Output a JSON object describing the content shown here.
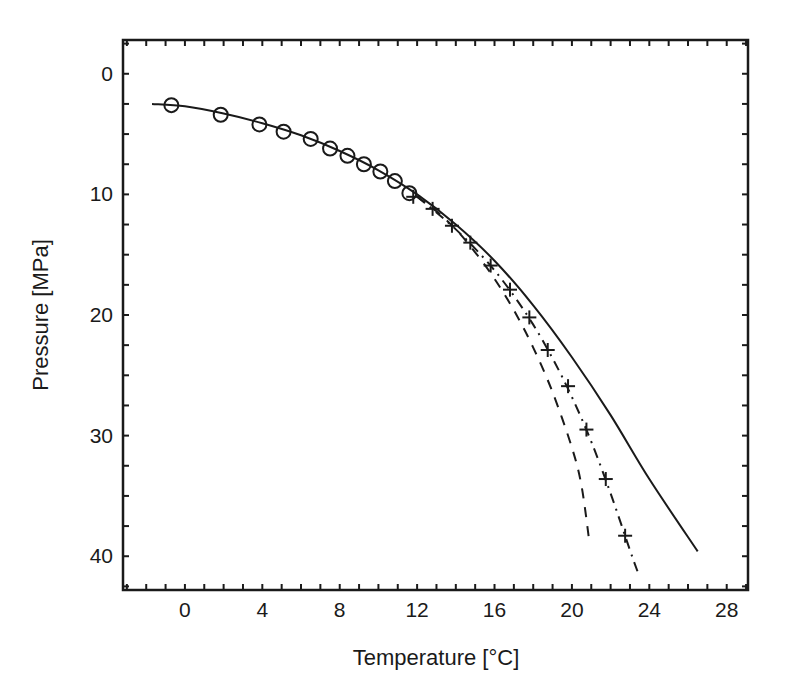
{
  "chart_data": {
    "type": "line",
    "title": "",
    "xlabel": "Temperature  [°C]",
    "ylabel": "Pressure  [MPa]",
    "xlim": [
      -3.2,
      29.1
    ],
    "ylim": [
      -2.8,
      42.8
    ],
    "y_inverted": true,
    "grid": false,
    "legend": null,
    "x_ticks": [
      0,
      4,
      8,
      12,
      16,
      20,
      24,
      28
    ],
    "y_ticks": [
      0,
      10,
      20,
      30,
      40
    ],
    "x_minor_step": 1,
    "y_minor_step": 2.5,
    "series": [
      {
        "name": "solid-curve",
        "style": "solid",
        "points": [
          [
            -1.7,
            2.5
          ],
          [
            0,
            2.7
          ],
          [
            2,
            3.3
          ],
          [
            4,
            4.1
          ],
          [
            6,
            5.1
          ],
          [
            8,
            6.4
          ],
          [
            10,
            8.0
          ],
          [
            12,
            10.0
          ],
          [
            14,
            12.5
          ],
          [
            16,
            15.5
          ],
          [
            18,
            19.2
          ],
          [
            20,
            23.5
          ],
          [
            22,
            28.3
          ],
          [
            24,
            33.6
          ],
          [
            26.5,
            39.6
          ]
        ]
      },
      {
        "name": "dashed-curve",
        "style": "dashed",
        "points": [
          [
            12,
            10.2
          ],
          [
            13,
            11.4
          ],
          [
            14,
            12.9
          ],
          [
            15,
            14.8
          ],
          [
            16,
            17.0
          ],
          [
            17,
            19.6
          ],
          [
            18,
            22.7
          ],
          [
            19,
            26.4
          ],
          [
            20,
            31.0
          ],
          [
            20.5,
            34.2
          ],
          [
            20.9,
            38.8
          ]
        ]
      },
      {
        "name": "dashdot-curve",
        "style": "dashdot",
        "points": [
          [
            12,
            10.2
          ],
          [
            13,
            11.5
          ],
          [
            14,
            12.9
          ],
          [
            15,
            14.5
          ],
          [
            16,
            16.3
          ],
          [
            17,
            18.4
          ],
          [
            18,
            20.8
          ],
          [
            19,
            23.6
          ],
          [
            20,
            26.8
          ],
          [
            21,
            30.5
          ],
          [
            22,
            34.8
          ],
          [
            23,
            39.5
          ],
          [
            23.4,
            41.3
          ]
        ]
      },
      {
        "name": "circle-markers",
        "style": "markers-circle",
        "points": [
          [
            -0.7,
            2.6
          ],
          [
            1.85,
            3.4
          ],
          [
            3.85,
            4.2
          ],
          [
            5.1,
            4.8
          ],
          [
            6.5,
            5.4
          ],
          [
            7.5,
            6.2
          ],
          [
            8.4,
            6.8
          ],
          [
            9.25,
            7.5
          ],
          [
            10.1,
            8.1
          ],
          [
            10.85,
            8.9
          ],
          [
            11.6,
            9.9
          ]
        ]
      },
      {
        "name": "cross-markers",
        "style": "markers-plus",
        "points": [
          [
            11.8,
            10.2
          ],
          [
            12.8,
            11.2
          ],
          [
            13.8,
            12.6
          ],
          [
            14.75,
            14.0
          ],
          [
            15.8,
            15.9
          ],
          [
            16.8,
            17.9
          ],
          [
            17.8,
            20.2
          ],
          [
            18.75,
            22.9
          ],
          [
            19.8,
            25.9
          ],
          [
            20.75,
            29.5
          ],
          [
            21.75,
            33.6
          ],
          [
            22.75,
            38.3
          ]
        ]
      }
    ]
  },
  "axes": {
    "xlabel": "Temperature  [°C]",
    "ylabel": "Pressure  [MPa]"
  },
  "colors": {
    "ink": "#1a1a1a",
    "background": "#ffffff"
  }
}
